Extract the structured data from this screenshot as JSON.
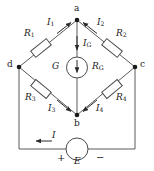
{
  "figure": {
    "type": "circuit-diagram",
    "name": "Wheatstone bridge",
    "colors": {
      "wire": "#4d4d4d",
      "ink": "#1a1a1a",
      "background": "#ffffff"
    }
  },
  "nodes": [
    {
      "id": "a",
      "label": "a",
      "x": 77,
      "y": 20
    },
    {
      "id": "b",
      "label": "b",
      "x": 77,
      "y": 115
    },
    {
      "id": "c",
      "label": "c",
      "x": 135,
      "y": 67
    },
    {
      "id": "d",
      "label": "d",
      "x": 19,
      "y": 67
    }
  ],
  "components": [
    {
      "id": "R1",
      "symbol": "R",
      "subscript": "1",
      "label": "R₁",
      "branch": "d-a"
    },
    {
      "id": "R2",
      "symbol": "R",
      "subscript": "2",
      "label": "R₂",
      "branch": "a-c"
    },
    {
      "id": "R3",
      "symbol": "R",
      "subscript": "3",
      "label": "R₃",
      "branch": "d-b"
    },
    {
      "id": "R4",
      "symbol": "R",
      "subscript": "4",
      "label": "R₄",
      "branch": "b-c"
    },
    {
      "id": "G",
      "symbol": "G",
      "subscript": "",
      "label": "G",
      "branch": "a-b",
      "meter_resistance_symbol": "R",
      "meter_resistance_subscript": "G",
      "meter_resistance_label": "Rₒ"
    },
    {
      "id": "E",
      "symbol": "E",
      "subscript": "",
      "label": "E",
      "branch": "d-b-c bottom",
      "plus": "+",
      "minus": "−"
    }
  ],
  "currents": [
    {
      "id": "I1",
      "symbol": "I",
      "subscript": "1",
      "label": "I₁",
      "direction": "toward node a"
    },
    {
      "id": "I2",
      "symbol": "I",
      "subscript": "2",
      "label": "I₂",
      "direction": "toward node a"
    },
    {
      "id": "IG",
      "symbol": "I",
      "subscript": "G",
      "label": "Iₒ",
      "direction": "a to b (downward)"
    },
    {
      "id": "I3",
      "symbol": "I",
      "subscript": "3",
      "label": "I₃",
      "direction": "toward node b"
    },
    {
      "id": "I4",
      "symbol": "I",
      "subscript": "4",
      "label": "I₄",
      "direction": "toward node b"
    },
    {
      "id": "I",
      "symbol": "I",
      "subscript": "",
      "label": "I",
      "direction": "leftward along bottom wire"
    }
  ],
  "labels": {
    "node_a": "a",
    "node_b": "b",
    "node_c": "c",
    "node_d": "d",
    "R1_base": "R",
    "R1_sub": "1",
    "R2_base": "R",
    "R2_sub": "2",
    "R3_base": "R",
    "R3_sub": "3",
    "R4_base": "R",
    "R4_sub": "4",
    "G": "G",
    "RG_base": "R",
    "RG_sub": "G",
    "I1_base": "I",
    "I1_sub": "1",
    "I2_base": "I",
    "I2_sub": "2",
    "IG_base": "I",
    "IG_sub": "G",
    "I3_base": "I",
    "I3_sub": "3",
    "I4_base": "I",
    "I4_sub": "4",
    "I_base": "I",
    "E": "E",
    "plus": "+",
    "minus": "−"
  }
}
